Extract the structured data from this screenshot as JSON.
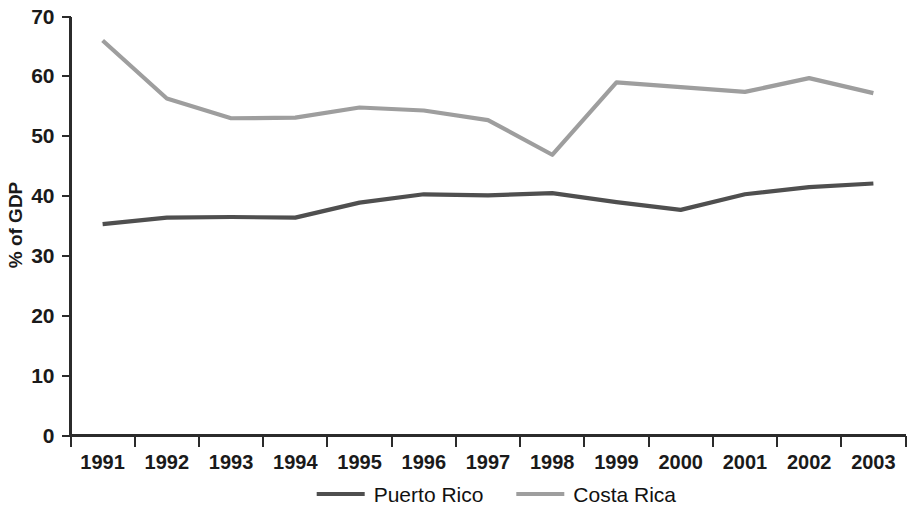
{
  "chart_data": {
    "type": "line",
    "title": "",
    "subtitle": "",
    "xlabel": "",
    "ylabel": "% of GDP",
    "x": [
      "1991",
      "1992",
      "1993",
      "1994",
      "1995",
      "1996",
      "1997",
      "1998",
      "1999",
      "2000",
      "2001",
      "2002",
      "2003"
    ],
    "categories": [
      "1991",
      "1992",
      "1993",
      "1994",
      "1995",
      "1996",
      "1997",
      "1998",
      "1999",
      "2000",
      "2001",
      "2002",
      "2003"
    ],
    "xlim": [
      "1991",
      "2003"
    ],
    "ylim": [
      0,
      70
    ],
    "yticks": [
      0,
      10,
      20,
      30,
      40,
      50,
      60,
      70
    ],
    "ytick_labels": [
      "0",
      "10",
      "20",
      "30",
      "40",
      "50",
      "60",
      "70"
    ],
    "grid": false,
    "legend_position": "bottom-center",
    "series": [
      {
        "name": "Puerto Rico",
        "color": "#4f4f4f",
        "values": [
          35.3,
          36.4,
          36.5,
          36.4,
          38.9,
          40.3,
          40.1,
          40.5,
          39.0,
          37.7,
          40.3,
          41.5,
          42.1
        ]
      },
      {
        "name": "Costa Rica",
        "color": "#9e9e9e",
        "values": [
          66.0,
          56.3,
          53.0,
          53.1,
          54.8,
          54.3,
          52.7,
          46.9,
          59.0,
          58.2,
          57.4,
          59.7,
          57.2
        ]
      }
    ]
  },
  "axes": {
    "y_title": "% of GDP"
  },
  "legend": {
    "items": [
      {
        "label": "Puerto Rico",
        "color": "#4f4f4f"
      },
      {
        "label": "Costa Rica",
        "color": "#9e9e9e"
      }
    ]
  },
  "colors": {
    "puerto_rico": "#4f4f4f",
    "costa_rica": "#9e9e9e",
    "axis": "#2b2b2b",
    "text": "#1a1a1a",
    "background": "#ffffff"
  }
}
